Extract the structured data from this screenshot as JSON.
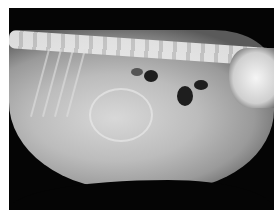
{
  "image": {
    "type": "lateral abdominal radiograph",
    "border_color": "#ffffff",
    "background_color": "#050505",
    "tissue_color": "#bcbcbc",
    "gas_color": "#1e1e1e"
  }
}
